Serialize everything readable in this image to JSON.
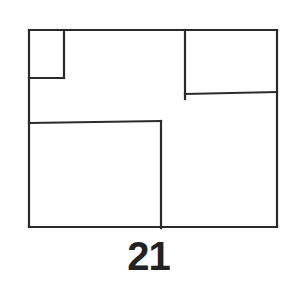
{
  "figure": {
    "label": "21",
    "stroke_color": "#2a2a2a",
    "background": "#ffffff",
    "outer_rect": {
      "x1": 29,
      "y1": 30,
      "x2": 277,
      "y2": 227
    },
    "segments": [
      {
        "name": "top-left-box-right",
        "x1": 64,
        "y1": 30,
        "x2": 64,
        "y2": 78
      },
      {
        "name": "top-left-box-bottom",
        "x1": 29,
        "y1": 78,
        "x2": 64,
        "y2": 78
      },
      {
        "name": "top-right-box-left",
        "x1": 185,
        "y1": 30,
        "x2": 185,
        "y2": 99
      },
      {
        "name": "top-right-box-bottom",
        "x1": 185,
        "y1": 94,
        "x2": 277,
        "y2": 92
      },
      {
        "name": "bottom-left-box-top",
        "x1": 29,
        "y1": 123,
        "x2": 161,
        "y2": 121
      },
      {
        "name": "bottom-left-box-right",
        "x1": 161,
        "y1": 121,
        "x2": 161,
        "y2": 228
      }
    ]
  }
}
